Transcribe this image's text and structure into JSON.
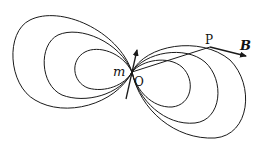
{
  "diagram": {
    "labels": {
      "moment": "m",
      "origin": "O",
      "point": "P",
      "field": "B"
    },
    "colors": {
      "stroke": "#1a1a1a",
      "background": "#ffffff"
    },
    "field_lines": {
      "left_count": 3,
      "right_count": 3
    }
  }
}
